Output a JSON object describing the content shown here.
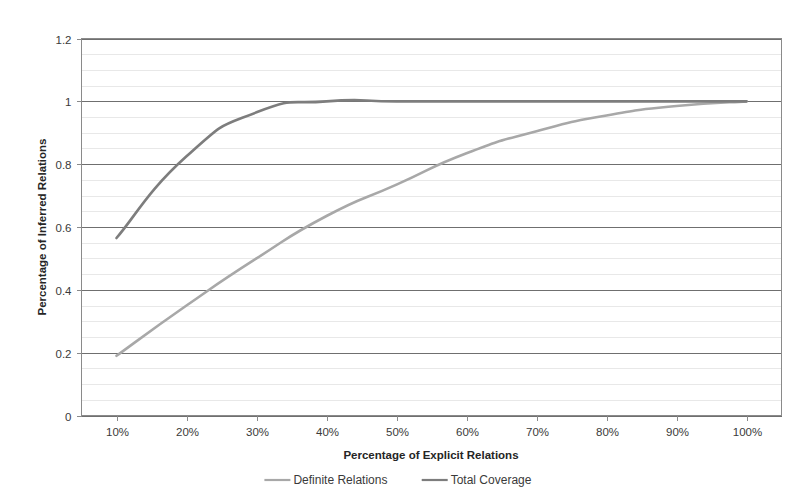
{
  "chart_data": {
    "type": "line",
    "title": "",
    "xlabel": "Percentage of Explicit Relations",
    "ylabel": "Percentage of Inferred Relations",
    "xlim": [
      5,
      105
    ],
    "ylim": [
      0,
      1.2
    ],
    "grid": true,
    "legend_position": "bottom",
    "x_tick_labels": [
      "10%",
      "20%",
      "30%",
      "40%",
      "50%",
      "60%",
      "70%",
      "80%",
      "90%",
      "100%"
    ],
    "x_tick_values": [
      10,
      20,
      30,
      40,
      50,
      60,
      70,
      80,
      90,
      100
    ],
    "y_tick_labels": [
      "0",
      "0.2",
      "0.4",
      "0.6",
      "0.8",
      "1",
      "1.2"
    ],
    "y_tick_values": [
      0,
      0.2,
      0.4,
      0.6,
      0.8,
      1,
      1.2
    ],
    "y_minor_step": 0.05,
    "x": [
      10,
      20,
      30,
      40,
      50,
      60,
      70,
      80,
      90,
      100
    ],
    "series": [
      {
        "name": "Definite Relations",
        "color": "#a8a8a8",
        "values": [
          0.19,
          0.35,
          0.5,
          0.635,
          0.735,
          0.835,
          0.905,
          0.955,
          0.985,
          1.0
        ]
      },
      {
        "name": "Total Coverage",
        "color": "#7d7d7d",
        "values": [
          0.565,
          0.825,
          0.965,
          1.0,
          1.0,
          1.0,
          1.0,
          1.0,
          1.0,
          1.0
        ]
      }
    ]
  },
  "legend": {
    "items": [
      {
        "label": "Definite Relations",
        "color": "#a8a8a8"
      },
      {
        "label": "Total Coverage",
        "color": "#7d7d7d"
      }
    ]
  },
  "axes": {
    "x_title": "Percentage of Explicit Relations",
    "y_title": "Percentage of Inferred Relations"
  }
}
